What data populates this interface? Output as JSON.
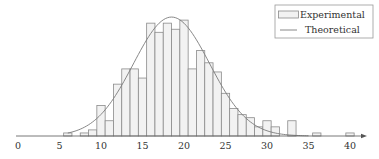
{
  "chart_data": {
    "type": "bar",
    "title": "",
    "xlabel": "",
    "ylabel": "",
    "xlim": [
      0,
      42
    ],
    "xticks": [
      0,
      5,
      10,
      15,
      20,
      25,
      30,
      35,
      40
    ],
    "grid": false,
    "legend_position": "upper right",
    "bin_width": 1,
    "series": [
      {
        "name": "Experimental",
        "kind": "histogram",
        "bins": [
          6,
          8,
          9,
          10,
          11,
          12,
          13,
          14,
          15,
          16,
          17,
          18,
          19,
          20,
          21,
          22,
          23,
          24,
          25,
          26,
          27,
          28,
          29,
          30,
          31,
          33,
          36,
          40
        ],
        "values": [
          1,
          1,
          2,
          10,
          5,
          17,
          22,
          22,
          19,
          37,
          34,
          37,
          35,
          38,
          22,
          28,
          24,
          21,
          14,
          9,
          7,
          6,
          3,
          5,
          3,
          5,
          1,
          1
        ]
      },
      {
        "name": "Theoretical",
        "kind": "line",
        "distribution": "normal",
        "mean": 18.5,
        "std": 4.6,
        "peak": 39
      }
    ]
  },
  "legend": {
    "items": [
      {
        "label": "Experimental",
        "symbol": "bar"
      },
      {
        "label": "Theoretical",
        "symbol": "line"
      }
    ]
  },
  "colors": {
    "bar_fill": "#f2f2f2",
    "bar_edge": "#8a8a8a",
    "curve": "#7a7a7a",
    "axis": "#555555",
    "text": "#333333"
  }
}
